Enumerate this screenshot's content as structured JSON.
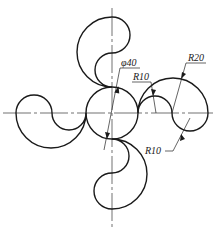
{
  "figure": {
    "type": "engineering-drawing",
    "center": [
      112,
      113
    ],
    "stroke_color": "#1a1a1a"
  },
  "dimensions": {
    "diameter": {
      "label": "φ40"
    },
    "r_small_top": {
      "label": "R10"
    },
    "r_large": {
      "label": "R20"
    },
    "r_small_bottom": {
      "label": "R10"
    }
  },
  "caption": {
    "text": "… …"
  }
}
